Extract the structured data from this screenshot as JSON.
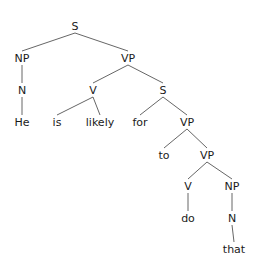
{
  "tree": {
    "nodes": [
      {
        "id": "s1",
        "label": "S",
        "x": 75,
        "y": 26
      },
      {
        "id": "np1",
        "label": "NP",
        "x": 22,
        "y": 58
      },
      {
        "id": "vp1",
        "label": "VP",
        "x": 128,
        "y": 58
      },
      {
        "id": "n1",
        "label": "N",
        "x": 22,
        "y": 90
      },
      {
        "id": "v1",
        "label": "V",
        "x": 93,
        "y": 90
      },
      {
        "id": "s2",
        "label": "S",
        "x": 163,
        "y": 90
      },
      {
        "id": "he",
        "label": "He",
        "x": 22,
        "y": 122
      },
      {
        "id": "is",
        "label": "is",
        "x": 57,
        "y": 122
      },
      {
        "id": "likely",
        "label": "likely",
        "x": 100,
        "y": 122
      },
      {
        "id": "for",
        "label": "for",
        "x": 140,
        "y": 122
      },
      {
        "id": "vp2",
        "label": "VP",
        "x": 187,
        "y": 122
      },
      {
        "id": "to",
        "label": "to",
        "x": 164,
        "y": 155
      },
      {
        "id": "vp3",
        "label": "VP",
        "x": 207,
        "y": 155
      },
      {
        "id": "v2",
        "label": "V",
        "x": 188,
        "y": 186
      },
      {
        "id": "np2",
        "label": "NP",
        "x": 232,
        "y": 186
      },
      {
        "id": "do",
        "label": "do",
        "x": 188,
        "y": 218
      },
      {
        "id": "n2",
        "label": "N",
        "x": 232,
        "y": 218
      },
      {
        "id": "that",
        "label": "that",
        "x": 234,
        "y": 249
      }
    ],
    "edges": [
      [
        "s1",
        "np1"
      ],
      [
        "s1",
        "vp1"
      ],
      [
        "np1",
        "n1"
      ],
      [
        "n1",
        "he"
      ],
      [
        "vp1",
        "v1"
      ],
      [
        "vp1",
        "s2"
      ],
      [
        "v1",
        "is"
      ],
      [
        "v1",
        "likely"
      ],
      [
        "s2",
        "for"
      ],
      [
        "s2",
        "vp2"
      ],
      [
        "vp2",
        "to"
      ],
      [
        "vp2",
        "vp3"
      ],
      [
        "vp3",
        "v2"
      ],
      [
        "vp3",
        "np2"
      ],
      [
        "v2",
        "do"
      ],
      [
        "np2",
        "n2"
      ],
      [
        "n2",
        "that"
      ]
    ]
  }
}
